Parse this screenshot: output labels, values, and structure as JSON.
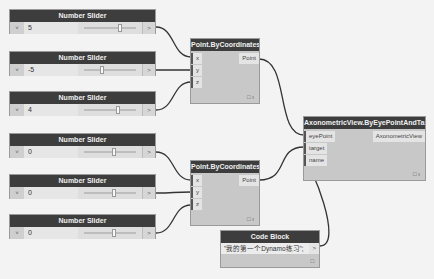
{
  "canvas": {
    "background": "#f3f3f3"
  },
  "sliders": [
    {
      "title": "Number Slider",
      "value": "5",
      "chevron": "˅",
      "output": ">"
    },
    {
      "title": "Number Slider",
      "value": "-5",
      "chevron": "˅",
      "output": ">"
    },
    {
      "title": "Number Slider",
      "value": "4",
      "chevron": "˅",
      "output": ">"
    },
    {
      "title": "Number Slider",
      "value": "0",
      "chevron": "˅",
      "output": ">"
    },
    {
      "title": "Number Slider",
      "value": "0",
      "chevron": "˅",
      "output": ">"
    },
    {
      "title": "Number Slider",
      "value": "0",
      "chevron": "˅",
      "output": ">"
    }
  ],
  "point_nodes": [
    {
      "title": "Point.ByCoordinates",
      "inputs": [
        "x",
        "y",
        "z"
      ],
      "output": "Point"
    },
    {
      "title": "Point.ByCoordinates",
      "inputs": [
        "x",
        "y",
        "z"
      ],
      "output": "Point"
    }
  ],
  "axon_node": {
    "title": "AxonometricView.ByEyePointAndTarget",
    "inputs": [
      "eyePoint",
      "target",
      "name"
    ],
    "output": "AxonometricView"
  },
  "code_block": {
    "title": "Code Block",
    "code": "\"我的第一个Dynamo练习\";",
    "output": ">"
  },
  "footer_icon": "□ ı"
}
